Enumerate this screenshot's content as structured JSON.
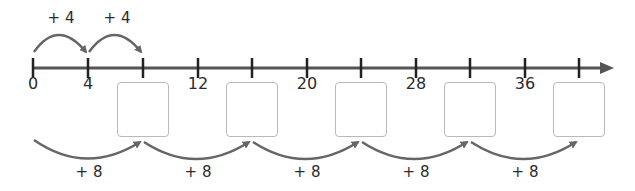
{
  "number_line": {
    "start": 0,
    "step": 4,
    "tick_count": 11,
    "tick_labels": [
      "0",
      "4",
      "",
      "12",
      "",
      "20",
      "",
      "28",
      "",
      "36",
      ""
    ],
    "answer_boxes_at_ticks": [
      2,
      4,
      6,
      8,
      10
    ],
    "answer_boxes": [
      "",
      "",
      "",
      "",
      ""
    ]
  },
  "top_jumps": [
    {
      "label": "+ 4",
      "from_tick": 0,
      "to_tick": 1
    },
    {
      "label": "+ 4",
      "from_tick": 1,
      "to_tick": 2
    }
  ],
  "bottom_jumps": [
    {
      "label": "+ 8",
      "from_tick": 0,
      "to_tick": 2
    },
    {
      "label": "+ 8",
      "from_tick": 2,
      "to_tick": 4
    },
    {
      "label": "+ 8",
      "from_tick": 4,
      "to_tick": 6
    },
    {
      "label": "+ 8",
      "from_tick": 6,
      "to_tick": 8
    },
    {
      "label": "+ 8",
      "from_tick": 8,
      "to_tick": 10
    }
  ],
  "colors": {
    "line": "#444444",
    "tick": "#222222",
    "arc": "#666666",
    "box_border": "#b9b9b9",
    "text": "#2b2b2b"
  }
}
